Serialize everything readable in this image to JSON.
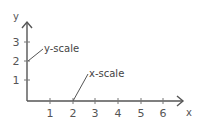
{
  "diagram": {
    "x_axis": {
      "name": "x",
      "ticks": [
        "1",
        "2",
        "3",
        "4",
        "5",
        "6"
      ]
    },
    "y_axis": {
      "name": "y",
      "ticks": [
        "1",
        "2",
        "3"
      ]
    },
    "annotations": {
      "y_scale": "y-scale",
      "x_scale": "x-scale"
    },
    "colors": {
      "axis": "#555555",
      "text": "#555555"
    }
  }
}
